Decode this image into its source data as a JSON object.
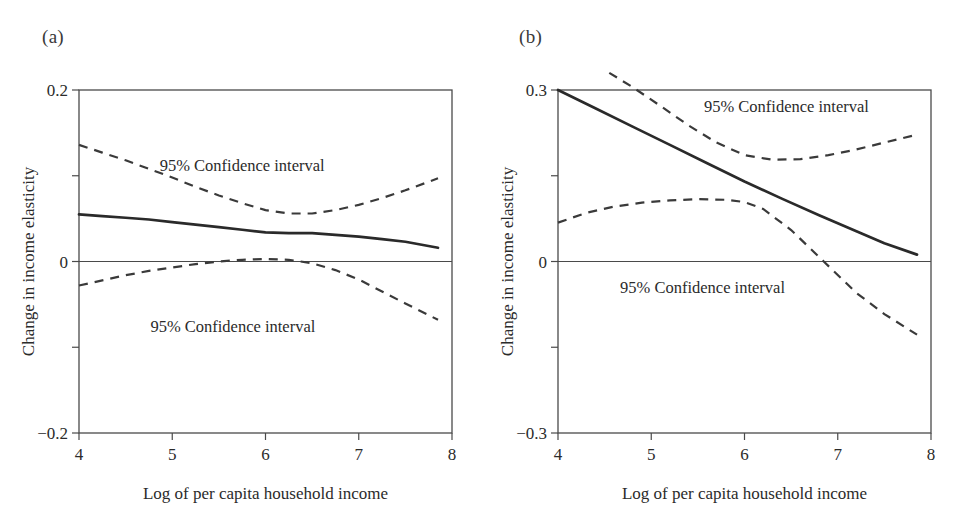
{
  "figure": {
    "panels": [
      {
        "id": "a",
        "label": "(a)",
        "xlabel": "Log of per capita household income",
        "ylabel": "Change in income elasticity",
        "annotation_upper": "95% Confidence interval",
        "annotation_lower": "95% Confidence interval",
        "xticklabels": [
          "4",
          "5",
          "6",
          "7",
          "8"
        ],
        "yticklabels": [
          "0.2",
          "0",
          "−0.2"
        ]
      },
      {
        "id": "b",
        "label": "(b)",
        "xlabel": "Log of per capita household income",
        "ylabel": "Change in income elasticity",
        "annotation_upper": "95% Confidence interval",
        "annotation_lower": "95% Confidence interval",
        "xticklabels": [
          "4",
          "5",
          "6",
          "7",
          "8"
        ],
        "yticklabels": [
          "0.3",
          "0",
          "−0.3"
        ]
      }
    ]
  },
  "chart_data": [
    {
      "type": "line",
      "panel": "a",
      "title": "(a)",
      "xlabel": "Log of per capita household income",
      "ylabel": "Change in income elasticity",
      "xlim": [
        4,
        8
      ],
      "ylim": [
        -0.2,
        0.2
      ],
      "xticks": [
        4,
        5,
        6,
        7,
        8
      ],
      "yticks": [
        0.2,
        0.1,
        0,
        -0.1,
        -0.2
      ],
      "ytick_labels_shown": [
        0.2,
        0,
        -0.2
      ],
      "grid": false,
      "legend": "none",
      "zero_reference_line": 0,
      "annotations": [
        {
          "text": "95% Confidence interval",
          "x": 5.75,
          "y": 0.105
        },
        {
          "text": "95% Confidence interval",
          "x": 5.65,
          "y": -0.082
        }
      ],
      "series": [
        {
          "name": "Point estimate",
          "style": "solid",
          "x": [
            4.0,
            4.25,
            4.5,
            4.75,
            5.0,
            5.25,
            5.5,
            5.75,
            6.0,
            6.25,
            6.5,
            6.75,
            7.0,
            7.25,
            7.5,
            7.85
          ],
          "values": [
            0.055,
            0.053,
            0.051,
            0.049,
            0.046,
            0.043,
            0.04,
            0.037,
            0.034,
            0.033,
            0.033,
            0.031,
            0.029,
            0.026,
            0.023,
            0.016
          ]
        },
        {
          "name": "95% CI upper",
          "style": "dashed",
          "x": [
            4.0,
            4.25,
            4.5,
            4.75,
            5.0,
            5.25,
            5.5,
            5.75,
            6.0,
            6.25,
            6.5,
            6.75,
            7.0,
            7.25,
            7.5,
            7.85
          ],
          "values": [
            0.136,
            0.127,
            0.118,
            0.108,
            0.098,
            0.087,
            0.077,
            0.068,
            0.06,
            0.056,
            0.056,
            0.06,
            0.066,
            0.074,
            0.083,
            0.097
          ]
        },
        {
          "name": "95% CI lower",
          "style": "dashed",
          "x": [
            4.0,
            4.25,
            4.5,
            4.75,
            5.0,
            5.25,
            5.5,
            5.75,
            6.0,
            6.25,
            6.5,
            6.75,
            7.0,
            7.25,
            7.5,
            7.85
          ],
          "values": [
            -0.028,
            -0.022,
            -0.016,
            -0.011,
            -0.007,
            -0.003,
            0.0,
            0.002,
            0.003,
            0.002,
            -0.002,
            -0.01,
            -0.021,
            -0.035,
            -0.049,
            -0.068
          ]
        }
      ]
    },
    {
      "type": "line",
      "panel": "b",
      "title": "(b)",
      "xlabel": "Log of per capita household income",
      "ylabel": "Change in income elasticity",
      "xlim": [
        4,
        8
      ],
      "ylim": [
        -0.3,
        0.3
      ],
      "xticks": [
        4,
        5,
        6,
        7,
        8
      ],
      "yticks": [
        0.3,
        0.15,
        0,
        -0.15,
        -0.3
      ],
      "ytick_labels_shown": [
        0.3,
        0,
        -0.3
      ],
      "grid": false,
      "legend": "none",
      "zero_reference_line": 0,
      "annotations": [
        {
          "text": "95% Confidence interval",
          "x": 6.45,
          "y": 0.262
        },
        {
          "text": "95% Confidence interval",
          "x": 5.55,
          "y": -0.055
        }
      ],
      "series": [
        {
          "name": "Point estimate",
          "style": "solid",
          "x": [
            4.0,
            4.4,
            4.8,
            5.2,
            5.6,
            6.0,
            6.4,
            6.8,
            7.2,
            7.5,
            7.85
          ],
          "values": [
            0.3,
            0.268,
            0.236,
            0.204,
            0.172,
            0.14,
            0.11,
            0.081,
            0.053,
            0.032,
            0.012
          ]
        },
        {
          "name": "95% CI upper",
          "style": "dashed",
          "x": [
            4.55,
            4.8,
            5.1,
            5.4,
            5.7,
            6.0,
            6.3,
            6.6,
            6.9,
            7.2,
            7.5,
            7.85
          ],
          "values": [
            0.33,
            0.305,
            0.272,
            0.238,
            0.208,
            0.186,
            0.178,
            0.179,
            0.186,
            0.196,
            0.208,
            0.222
          ]
        },
        {
          "name": "95% CI lower",
          "style": "dashed",
          "x": [
            4.0,
            4.3,
            4.6,
            4.9,
            5.2,
            5.5,
            5.8,
            6.0,
            6.2,
            6.5,
            6.85,
            7.2,
            7.5,
            7.85
          ],
          "values": [
            0.068,
            0.085,
            0.096,
            0.103,
            0.107,
            0.109,
            0.108,
            0.104,
            0.092,
            0.055,
            0.0,
            -0.055,
            -0.092,
            -0.128
          ]
        }
      ]
    }
  ]
}
